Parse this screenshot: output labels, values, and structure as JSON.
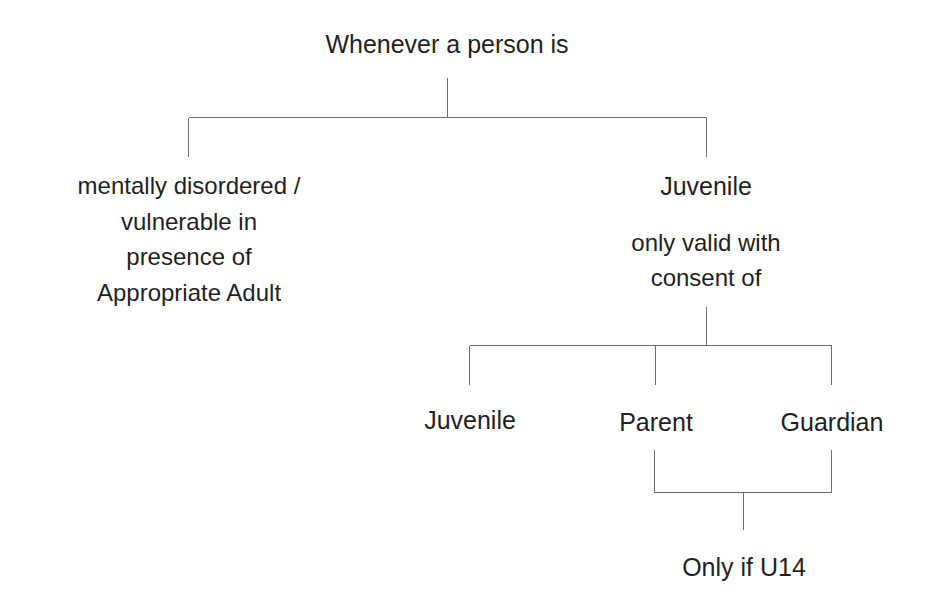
{
  "diagram": {
    "title": "Whenever a person is",
    "line_color": "#6e6e6e",
    "text_color": "#1f1f1f",
    "background_color": "#ffffff",
    "nodes": {
      "root": {
        "label": "Whenever a person is"
      },
      "left_branch": {
        "line1": "mentally disordered /",
        "line2": "vulnerable in",
        "line3": "presence of",
        "line4": "Appropriate Adult"
      },
      "right_branch": {
        "title": "Juvenile",
        "sub_line1": "only valid with",
        "sub_line2": "consent of"
      },
      "consent_juvenile": {
        "label": "Juvenile"
      },
      "consent_parent": {
        "label": "Parent"
      },
      "consent_guardian": {
        "label": "Guardian"
      },
      "age_condition": {
        "label": "Only if U14"
      }
    }
  }
}
